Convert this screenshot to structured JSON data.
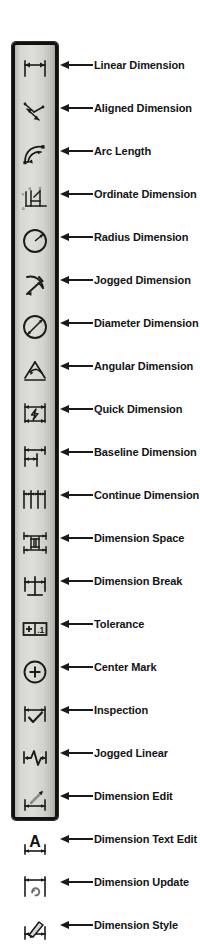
{
  "toolbar": {
    "name": "Dimension Toolbar",
    "orientation": "vertical",
    "background_color": "#d6d6d0",
    "border_color": "#111111",
    "arrow_color": "#1a1a1a",
    "label_color": "#141414",
    "items": [
      {
        "icon": "linear-dimension-icon",
        "label": "Linear Dimension"
      },
      {
        "icon": "aligned-dimension-icon",
        "label": "Aligned Dimension"
      },
      {
        "icon": "arc-length-icon",
        "label": "Arc Length"
      },
      {
        "icon": "ordinate-dimension-icon",
        "label": "Ordinate Dimension"
      },
      {
        "icon": "radius-dimension-icon",
        "label": "Radius Dimension"
      },
      {
        "icon": "jogged-dimension-icon",
        "label": "Jogged Dimension"
      },
      {
        "icon": "diameter-dimension-icon",
        "label": "Diameter Dimension"
      },
      {
        "icon": "angular-dimension-icon",
        "label": "Angular Dimension"
      },
      {
        "icon": "quick-dimension-icon",
        "label": "Quick Dimension"
      },
      {
        "icon": "baseline-dimension-icon",
        "label": "Baseline Dimension"
      },
      {
        "icon": "continue-dimension-icon",
        "label": "Continue Dimension"
      },
      {
        "icon": "dimension-space-icon",
        "label": "Dimension Space"
      },
      {
        "icon": "dimension-break-icon",
        "label": "Dimension Break"
      },
      {
        "icon": "tolerance-icon",
        "label": "Tolerance"
      },
      {
        "icon": "center-mark-icon",
        "label": "Center Mark"
      },
      {
        "icon": "inspection-icon",
        "label": "Inspection"
      },
      {
        "icon": "jogged-linear-icon",
        "label": "Jogged Linear"
      },
      {
        "icon": "dimension-edit-icon",
        "label": "Dimension Edit"
      },
      {
        "icon": "dimension-text-edit-icon",
        "label": "Dimension Text Edit"
      },
      {
        "icon": "dimension-update-icon",
        "label": "Dimension Update"
      },
      {
        "icon": "dimension-style-icon",
        "label": "Dimension Style"
      }
    ]
  }
}
